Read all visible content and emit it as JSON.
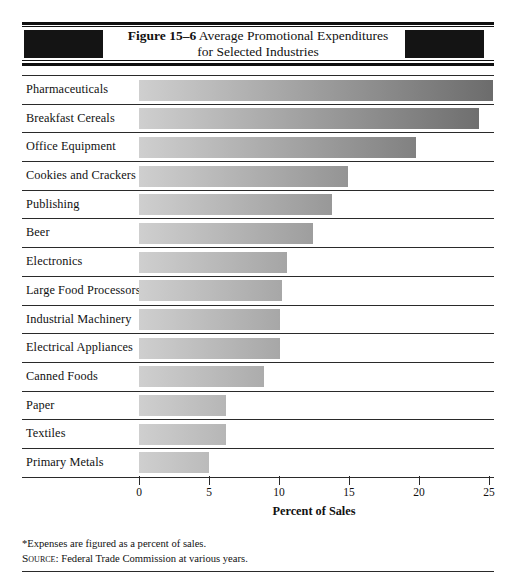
{
  "figure": {
    "number_label": "Figure 15–6",
    "title_line1": "Average Promotional Expenditures",
    "title_line2": "for Selected Industries"
  },
  "axis": {
    "title": "Percent of Sales",
    "tick_labels": [
      "0",
      "5",
      "10",
      "15",
      "20",
      "25"
    ]
  },
  "notes": {
    "footnote": "*Expenses are figured as a percent of sales.",
    "source_prefix": "Source:",
    "source_text": " Federal Trade Commission at various years."
  },
  "colors": {
    "bar_gradient_start": "#cfcfcf",
    "bar_gradient_end": "#6c6c6c",
    "rule": "#2a2a2a",
    "band_block": "#141414",
    "background": "#ffffff"
  },
  "chart_data": {
    "type": "bar",
    "orientation": "horizontal",
    "title": "Average Promotional Expenditures for Selected Industries",
    "xlabel": "Percent of Sales",
    "ylabel": "",
    "xlim": [
      0,
      25
    ],
    "xticks": [
      0,
      5,
      10,
      15,
      20,
      25
    ],
    "grid": false,
    "legend": "none",
    "categories": [
      "Pharmaceuticals",
      "Breakfast Cereals",
      "Office Equipment",
      "Cookies and Crackers",
      "Publishing",
      "Beer",
      "Electronics",
      "Large Food Processors",
      "Industrial Machinery",
      "Electrical Appliances",
      "Canned Foods",
      "Paper",
      "Textiles",
      "Primary Metals"
    ],
    "values": [
      25.3,
      24.3,
      19.8,
      14.9,
      13.8,
      12.4,
      10.6,
      10.2,
      10.1,
      10.1,
      8.9,
      6.2,
      6.2,
      5.0
    ]
  }
}
